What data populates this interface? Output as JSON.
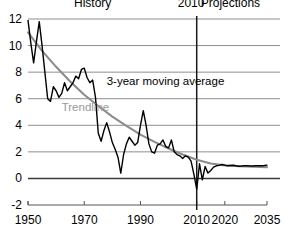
{
  "chart_data": {
    "type": "line",
    "title": "",
    "subtitle": "",
    "xlabel": "",
    "ylabel": "",
    "xlim": [
      1950,
      2035
    ],
    "ylim": [
      -2,
      12
    ],
    "yticks": [
      "12",
      "10",
      "8",
      "6",
      "4",
      "2",
      "0",
      "-2"
    ],
    "ytick_values": [
      12,
      10,
      8,
      6,
      4,
      2,
      0,
      -2
    ],
    "xticks": [
      "1950",
      "1970",
      "1990",
      "2010",
      "2020",
      "2035"
    ],
    "xtick_values": [
      1950,
      1970,
      1990,
      2010,
      2020,
      2035
    ],
    "grid": "horizontal",
    "zero_line": 0,
    "legend_position": "inline-annotations",
    "annotations": [
      {
        "name": "history-label",
        "text": "History",
        "x": 1973,
        "y": 12.9
      },
      {
        "name": "divider-year-label",
        "text": "2010",
        "x": 2008,
        "y": 12.9
      },
      {
        "name": "projections-label",
        "text": "Projections",
        "x": 2022,
        "y": 12.9
      },
      {
        "name": "series-label",
        "text": "3-year moving average",
        "x": 1978,
        "y": 7.0
      },
      {
        "name": "trendline-label",
        "text": "Trendline",
        "x": 1962,
        "y": 5.1
      }
    ],
    "divider": {
      "name": "year-2010-divider",
      "x": 2010,
      "label": "2010"
    },
    "series": [
      {
        "name": "3-year moving average",
        "color": "#000000",
        "x": [
          1950,
          1951,
          1952,
          1953,
          1954,
          1955,
          1956,
          1957,
          1958,
          1959,
          1960,
          1961,
          1962,
          1963,
          1964,
          1965,
          1966,
          1967,
          1968,
          1969,
          1970,
          1971,
          1972,
          1973,
          1974,
          1975,
          1976,
          1977,
          1978,
          1979,
          1980,
          1981,
          1982,
          1983,
          1984,
          1985,
          1986,
          1987,
          1988,
          1989,
          1990,
          1991,
          1992,
          1993,
          1994,
          1995,
          1996,
          1997,
          1998,
          1999,
          2000,
          2001,
          2002,
          2003,
          2004,
          2005,
          2006,
          2007,
          2008,
          2009,
          2010,
          2011,
          2012,
          2013,
          2014,
          2015,
          2016,
          2017,
          2018,
          2019,
          2020,
          2021,
          2022,
          2023,
          2024,
          2025,
          2026,
          2027,
          2028,
          2029,
          2030,
          2031,
          2032,
          2033,
          2034,
          2035
        ],
        "values": [
          11.9,
          10.2,
          8.7,
          10.3,
          11.8,
          10.0,
          8.0,
          6.0,
          5.8,
          6.9,
          6.6,
          6.1,
          6.4,
          7.2,
          6.6,
          6.9,
          7.2,
          7.7,
          7.5,
          8.2,
          8.3,
          7.6,
          7.2,
          7.4,
          6.1,
          3.4,
          2.8,
          3.6,
          4.2,
          3.5,
          2.7,
          2.2,
          1.6,
          0.4,
          1.8,
          2.6,
          3.1,
          2.8,
          2.5,
          2.7,
          4.0,
          5.1,
          4.0,
          2.6,
          2.0,
          1.9,
          2.5,
          2.6,
          2.9,
          2.4,
          2.3,
          2.9,
          2.0,
          1.8,
          1.7,
          1.5,
          1.7,
          1.6,
          1.3,
          0.3,
          -0.8,
          1.1,
          -0.1,
          0.9,
          0.4,
          0.6,
          0.85,
          0.95,
          0.98,
          1.05,
          1.0,
          0.95,
          0.97,
          0.99,
          0.95,
          0.92,
          0.93,
          0.95,
          0.96,
          0.94,
          0.93,
          0.95,
          0.96,
          0.95,
          0.97,
          1.0
        ]
      },
      {
        "name": "Trendline",
        "color": "#8c8c8c",
        "x": [
          1950,
          1955,
          1960,
          1965,
          1970,
          1975,
          1980,
          1985,
          1990,
          1995,
          2000,
          2005,
          2010,
          2015,
          2020,
          2025,
          2030,
          2035
        ],
        "values": [
          11.0,
          9.6,
          8.4,
          7.3,
          6.3,
          5.45,
          4.65,
          3.95,
          3.3,
          2.75,
          2.25,
          1.8,
          1.4,
          1.12,
          0.98,
          0.92,
          0.88,
          0.85
        ]
      }
    ]
  },
  "axes": {
    "y_axis_name": "y-axis",
    "x_axis_name": "x-axis"
  }
}
